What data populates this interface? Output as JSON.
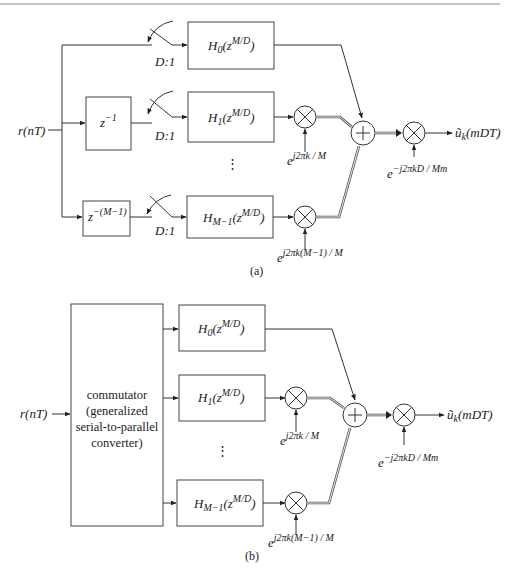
{
  "figure": {
    "top_rule": true,
    "panel_a": {
      "caption": "(a)",
      "input_label": "r(nT)",
      "delay_blocks": [
        {
          "label": "z",
          "exp": "−1"
        },
        {
          "label": "z",
          "exp": "−(M−1)"
        }
      ],
      "decimator_label": "D:1",
      "filters": [
        {
          "base": "H",
          "sub": "0",
          "arg": "(z",
          "exp": "M/D",
          "close": ")"
        },
        {
          "base": "H",
          "sub": "1",
          "arg": "(z",
          "exp": "M/D",
          "close": ")"
        },
        {
          "base": "H",
          "sub": "M−1",
          "arg": "(z",
          "exp": "M/D",
          "close": ")"
        }
      ],
      "ellipsis": "⋮",
      "phase_factors": [
        {
          "base": "e",
          "exp": "j2πk / M"
        },
        {
          "base": "e",
          "exp": "j2πk(M−1) / M"
        }
      ],
      "output_factor": {
        "base": "e",
        "exp": "−j2πkD / Mm"
      },
      "output_label": {
        "base": "ũ",
        "sub": "k",
        "arg": "(mDT)"
      },
      "adder_symbol": "+",
      "multiplier_symbol": "×"
    },
    "panel_b": {
      "caption": "(b)",
      "input_label": "r(nT)",
      "commutator_lines": [
        "commutator",
        "(generalized",
        "serial-to-parallel",
        "converter)"
      ],
      "filters": [
        {
          "base": "H",
          "sub": "0",
          "arg": "(z",
          "exp": "M/D",
          "close": ")"
        },
        {
          "base": "H",
          "sub": "1",
          "arg": "(z",
          "exp": "M/D",
          "close": ")"
        },
        {
          "base": "H",
          "sub": "M−1",
          "arg": "(z",
          "exp": "M/D",
          "close": ")"
        }
      ],
      "ellipsis": "⋮",
      "phase_factors": [
        {
          "base": "e",
          "exp": "j2πk / M"
        },
        {
          "base": "e",
          "exp": "j2πk(M−1) / M"
        }
      ],
      "output_factor": {
        "base": "e",
        "exp": "−j2πkD / Mm"
      },
      "output_label": {
        "base": "ũ",
        "sub": "k",
        "arg": "(mDT)"
      }
    }
  }
}
